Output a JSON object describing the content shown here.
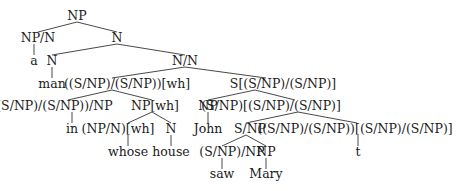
{
  "diagram": {
    "type": "syntax-tree",
    "nodes": [
      {
        "id": "n0",
        "label": "NP",
        "x": 77,
        "y": 16
      },
      {
        "id": "n1",
        "label": "NP/N",
        "x": 34,
        "y": 38
      },
      {
        "id": "n2",
        "label": "N",
        "x": 117,
        "y": 38
      },
      {
        "id": "n3",
        "label": "a",
        "x": 34,
        "y": 61
      },
      {
        "id": "n4",
        "label": "N",
        "x": 52,
        "y": 61
      },
      {
        "id": "n5",
        "label": "N/N",
        "x": 185,
        "y": 61
      },
      {
        "id": "n6",
        "label": "man",
        "x": 52,
        "y": 84
      },
      {
        "id": "n7",
        "label": "((S/NP)/(S/NP))[wh]",
        "x": 140,
        "y": 84
      },
      {
        "id": "n8",
        "label": "S[(S/NP)/(S/NP)]",
        "x": 331,
        "y": 84
      },
      {
        "id": "n9",
        "label": "((S/NP)/(S/NP))/NP",
        "x": 60,
        "y": 106
      },
      {
        "id": "n10",
        "label": "NP[wh]",
        "x": 158,
        "y": 106
      },
      {
        "id": "n11",
        "label": "NP",
        "x": 298,
        "y": 106
      },
      {
        "id": "n12",
        "label": "(S/NP)[(S/NP)/(S/NP)]",
        "x": 375,
        "y": 106
      },
      {
        "id": "n13",
        "label": "in",
        "x": 72,
        "y": 129
      },
      {
        "id": "n14",
        "label": "(NP/N)[wh]",
        "x": 128,
        "y": 129
      },
      {
        "id": "n15",
        "label": "N",
        "x": 171,
        "y": 129
      },
      {
        "id": "n16",
        "label": "John",
        "x": 298,
        "y": 129
      },
      {
        "id": "n17",
        "label": "S/NP",
        "x": 311,
        "y": 129
      },
      {
        "id": "n18",
        "label": "((S/NP)/(S/NP))[(S/NP)/(S/NP)]",
        "x": 380,
        "y": 129
      },
      {
        "id": "n19",
        "label": "whose",
        "x": 128,
        "y": 152
      },
      {
        "id": "n20",
        "label": "house",
        "x": 171,
        "y": 152
      },
      {
        "id": "n21",
        "label": "(S/NP)/NP",
        "x": 283,
        "y": 152
      },
      {
        "id": "n22",
        "label": "NP",
        "x": 327,
        "y": 152
      },
      {
        "id": "n23",
        "label": "t",
        "x": 357,
        "y": 152
      },
      {
        "id": "n24",
        "label": "saw",
        "x": 283,
        "y": 174
      },
      {
        "id": "n25",
        "label": "Mary",
        "x": 327,
        "y": 174
      }
    ],
    "edges": [
      {
        "from": "n0",
        "to": "n1",
        "x1": 77,
        "y1": 22,
        "x2": 38,
        "y2": 32
      },
      {
        "from": "n0",
        "to": "n2",
        "x1": 77,
        "y1": 22,
        "x2": 117,
        "y2": 32
      },
      {
        "from": "n1",
        "to": "n3",
        "x1": 34,
        "y1": 44,
        "x2": 34,
        "y2": 55
      },
      {
        "from": "n2",
        "to": "n4",
        "x1": 117,
        "y1": 44,
        "x2": 52,
        "y2": 55
      },
      {
        "from": "n2",
        "to": "n5",
        "x1": 117,
        "y1": 44,
        "x2": 185,
        "y2": 55
      },
      {
        "from": "n4",
        "to": "n6",
        "x1": 52,
        "y1": 67,
        "x2": 52,
        "y2": 78
      },
      {
        "from": "n5",
        "to": "n7",
        "x1": 185,
        "y1": 67,
        "x2": 112,
        "y2": 78
      },
      {
        "from": "n5",
        "to": "n8",
        "x1": 185,
        "y1": 67,
        "x2": 266,
        "y2": 78
      },
      {
        "from": "n7",
        "to": "n9",
        "x1": 112,
        "y1": 90,
        "x2": 68,
        "y2": 100
      },
      {
        "from": "n7",
        "to": "n10",
        "x1": 112,
        "y1": 90,
        "x2": 152,
        "y2": 100
      },
      {
        "from": "n8",
        "to": "n11",
        "x1": 255,
        "y1": 90,
        "x2": 208,
        "y2": 100
      },
      {
        "from": "n8",
        "to": "n12",
        "x1": 255,
        "y1": 90,
        "x2": 295,
        "y2": 100
      },
      {
        "from": "n9",
        "to": "n13",
        "x1": 72,
        "y1": 112,
        "x2": 72,
        "y2": 123
      },
      {
        "from": "n10",
        "to": "n14",
        "x1": 152,
        "y1": 112,
        "x2": 128,
        "y2": 123
      },
      {
        "from": "n10",
        "to": "n15",
        "x1": 152,
        "y1": 112,
        "x2": 171,
        "y2": 123
      },
      {
        "from": "n11",
        "to": "n16",
        "x1": 208,
        "y1": 112,
        "x2": 208,
        "y2": 123
      },
      {
        "from": "n12",
        "to": "n17",
        "x1": 298,
        "y1": 112,
        "x2": 246,
        "y2": 123
      },
      {
        "from": "n12",
        "to": "n18",
        "x1": 298,
        "y1": 112,
        "x2": 357,
        "y2": 123
      },
      {
        "from": "n14",
        "to": "n19",
        "x1": 128,
        "y1": 135,
        "x2": 128,
        "y2": 146
      },
      {
        "from": "n15",
        "to": "n20",
        "x1": 171,
        "y1": 135,
        "x2": 171,
        "y2": 146
      },
      {
        "from": "n17",
        "to": "n21",
        "x1": 246,
        "y1": 135,
        "x2": 222,
        "y2": 146
      },
      {
        "from": "n17",
        "to": "n22",
        "x1": 246,
        "y1": 135,
        "x2": 266,
        "y2": 146
      },
      {
        "from": "n18",
        "to": "n23",
        "x1": 358,
        "y1": 135,
        "x2": 358,
        "y2": 146
      },
      {
        "from": "n21",
        "to": "n24",
        "x1": 222,
        "y1": 158,
        "x2": 222,
        "y2": 169
      },
      {
        "from": "n22",
        "to": "n25",
        "x1": 266,
        "y1": 158,
        "x2": 266,
        "y2": 169
      }
    ]
  }
}
